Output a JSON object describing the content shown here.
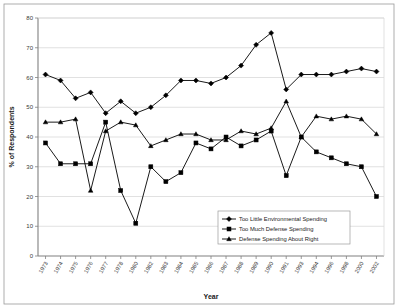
{
  "chart_data": {
    "type": "line",
    "title": "",
    "xlabel": "Year",
    "ylabel": "% of Respondents",
    "ylim": [
      0,
      80
    ],
    "yticks": [
      0,
      10,
      20,
      30,
      40,
      50,
      60,
      70,
      80
    ],
    "grid": true,
    "legend_position": "inside-bottom-right",
    "categories": [
      "1973",
      "1974",
      "1975",
      "1976",
      "1977",
      "1978",
      "1980",
      "1982",
      "1983",
      "1984",
      "1985",
      "1986",
      "1987",
      "1988",
      "1989",
      "1990",
      "1991",
      "1993",
      "1994",
      "1996",
      "1998",
      "2000",
      "2002"
    ],
    "series": [
      {
        "name": "Too Little Environmental Spending",
        "marker": "diamond",
        "values": [
          61,
          59,
          53,
          55,
          48,
          52,
          48,
          50,
          54,
          59,
          59,
          58,
          60,
          64,
          71,
          75,
          56,
          61,
          61,
          61,
          62,
          63,
          62
        ]
      },
      {
        "name": "Too Much Defense Spending",
        "marker": "square",
        "values": [
          38,
          31,
          31,
          31,
          45,
          22,
          11,
          30,
          25,
          28,
          38,
          36,
          40,
          37,
          39,
          42,
          27,
          40,
          35,
          33,
          31,
          30,
          20
        ]
      },
      {
        "name": "Defense Spending About Right",
        "marker": "triangle",
        "values": [
          45,
          45,
          46,
          22,
          42,
          45,
          44,
          37,
          39,
          41,
          41,
          39,
          39,
          42,
          41,
          43,
          52,
          40,
          47,
          46,
          47,
          46,
          41
        ]
      }
    ]
  },
  "legend": {
    "items": [
      {
        "label": "Too Little Environmental Spending",
        "marker": "diamond"
      },
      {
        "label": "Too Much Defense Spending",
        "marker": "square"
      },
      {
        "label": "Defense Spending About Right",
        "marker": "triangle"
      }
    ]
  },
  "colors": {
    "line": "#000000",
    "marker": "#000000",
    "grid": "#d9d9d9",
    "axis": "#808080",
    "frame": "#9a9a9a",
    "background": "#ffffff"
  }
}
